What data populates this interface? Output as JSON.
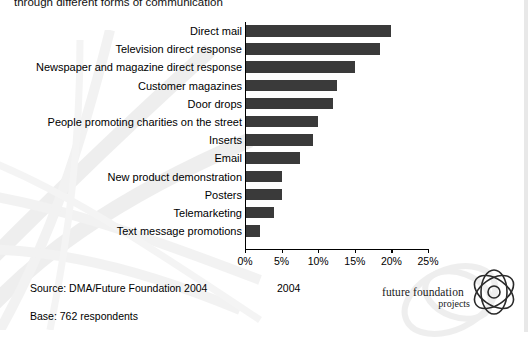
{
  "title": "through different forms of communication",
  "chart_data": {
    "type": "bar",
    "orientation": "horizontal",
    "title": "through different forms of communication",
    "xlabel": "",
    "ylabel": "",
    "xlim": [
      0,
      25
    ],
    "xticks": [
      "0%",
      "5%",
      "10%",
      "15%",
      "20%",
      "25%"
    ],
    "xtick_values": [
      0,
      5,
      10,
      15,
      20,
      25
    ],
    "grid": false,
    "legend": "2004",
    "legend_position": "bottom-center",
    "bar_color": "#3a3a3a",
    "categories": [
      "Direct mail",
      "Television direct response",
      "Newspaper and magazine direct response",
      "Customer magazines",
      "Door drops",
      "People promoting charities on the street",
      "Inserts",
      "Email",
      "New product demonstration",
      "Posters",
      "Telemarketing",
      "Text message promotions"
    ],
    "values": [
      20.0,
      18.5,
      15.0,
      12.5,
      12.0,
      10.0,
      9.3,
      7.5,
      5.0,
      5.0,
      4.0,
      2.0
    ]
  },
  "footer": {
    "source": "Source: DMA/Future Foundation 2004",
    "legend_year": "2004",
    "base": "Base: 762 respondents"
  },
  "logo": {
    "main": "future foundation",
    "sub": "projects"
  }
}
